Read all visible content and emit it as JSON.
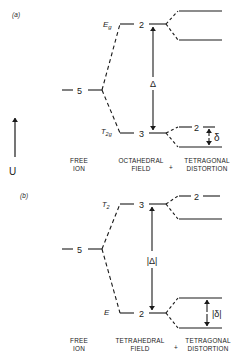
{
  "panels": [
    {
      "id": "a",
      "panel_label": "(a)",
      "upper_state": {
        "symbol": "E",
        "sub": "g",
        "degeneracy": "2"
      },
      "lower_state": {
        "symbol": "T",
        "sub": "2g",
        "degeneracy": "3"
      },
      "free_ion_degeneracy": "5",
      "field_splitting_label": "Δ",
      "distortion_splitting_label": "δ",
      "lower_split_upper_degeneracy": "2",
      "column_labels": {
        "free_ion": [
          "FREE",
          "ION"
        ],
        "field": [
          "OCTAHEDRAL",
          "FIELD"
        ],
        "plus": "+",
        "distortion": [
          "TETRAGONAL",
          "DISTORTION"
        ]
      }
    },
    {
      "id": "b",
      "panel_label": "(b)",
      "upper_state": {
        "symbol": "T",
        "sub": "2",
        "degeneracy": "3"
      },
      "lower_state": {
        "symbol": "E",
        "sub": "",
        "degeneracy": "2"
      },
      "free_ion_degeneracy": "5",
      "field_splitting_label": "|Δ|",
      "distortion_splitting_label": "|δ|",
      "upper_split_upper_degeneracy": "2",
      "column_labels": {
        "free_ion": [
          "FREE",
          "ION"
        ],
        "field": [
          "TETRAHEDRAL",
          "FIELD"
        ],
        "plus": "+",
        "distortion": [
          "TETRAGONAL",
          "DISTORTION"
        ]
      }
    }
  ],
  "energy_axis": {
    "label": "U"
  }
}
